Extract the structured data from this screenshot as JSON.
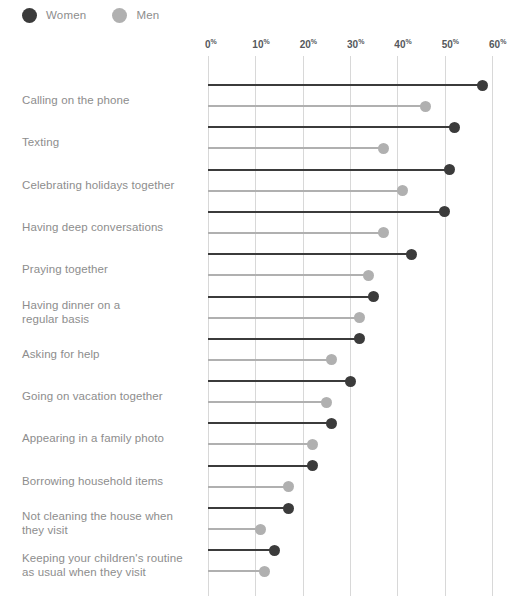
{
  "legend": {
    "items": [
      {
        "label": "Women",
        "color": "#3b3b3b"
      },
      {
        "label": "Men",
        "color": "#b0b0b0"
      }
    ]
  },
  "axis": {
    "ticks": [
      "0",
      "10",
      "20",
      "30",
      "40",
      "50",
      "60"
    ],
    "unit": "%"
  },
  "chart_data": {
    "type": "bar",
    "subtype": "lollipop-dot-plot",
    "title": "",
    "subtitle": "",
    "xlabel": "",
    "ylabel": "",
    "xlim": [
      0,
      60
    ],
    "xticks": [
      0,
      10,
      20,
      30,
      40,
      50,
      60
    ],
    "xtick_labels": [
      "0%",
      "10%",
      "20%",
      "30%",
      "40%",
      "50%",
      "60%"
    ],
    "grid": "vertical",
    "legend_position": "top-left",
    "categories": [
      "Calling on the phone",
      "Texting",
      "Celebrating holidays together",
      "Having deep conversations",
      "Praying together",
      "Having dinner on a regular basis",
      "Asking for help",
      "Going on vacation together",
      "Appearing in a family photo",
      "Borrowing household items",
      "Not cleaning the house when they visit",
      "Keeping your children's routine as usual when they visit"
    ],
    "category_lines": [
      [
        "Calling on the phone"
      ],
      [
        "Texting"
      ],
      [
        "Celebrating holidays together"
      ],
      [
        "Having deep conversations"
      ],
      [
        "Praying together"
      ],
      [
        "Having dinner on a",
        "regular basis"
      ],
      [
        "Asking for help"
      ],
      [
        "Going on vacation together"
      ],
      [
        "Appearing in a family photo"
      ],
      [
        "Borrowing household items"
      ],
      [
        "Not cleaning the house when",
        "they visit"
      ],
      [
        "Keeping your children's routine",
        "as usual when they visit"
      ]
    ],
    "series": [
      {
        "name": "Women",
        "color": "#3b3b3b",
        "values": [
          58,
          52,
          51,
          50,
          43,
          35,
          32,
          30,
          26,
          22,
          17,
          14
        ]
      },
      {
        "name": "Men",
        "color": "#b0b0b0",
        "values": [
          46,
          37,
          41,
          37,
          34,
          32,
          26,
          25,
          22,
          17,
          11,
          12
        ]
      }
    ]
  }
}
